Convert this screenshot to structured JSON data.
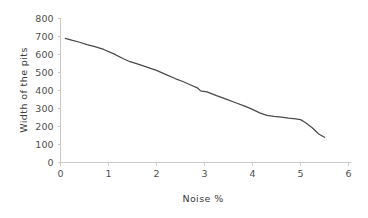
{
  "chart_data": {
    "type": "line",
    "title": "",
    "xlabel": "Noise %",
    "ylabel": "Width of the pits",
    "xlim": [
      0,
      6
    ],
    "ylim": [
      0,
      800
    ],
    "x_ticks": [
      0,
      1,
      2,
      3,
      4,
      5,
      6
    ],
    "y_ticks": [
      0,
      100,
      200,
      300,
      400,
      500,
      600,
      700,
      800
    ],
    "x_tick_labels": [
      "0",
      "1",
      "2",
      "3",
      "4",
      "5",
      "6"
    ],
    "y_tick_labels": [
      "0",
      "100",
      "200",
      "300",
      "400",
      "500",
      "600",
      "700",
      "800"
    ],
    "grid": false,
    "legend": null,
    "legend_position": "none",
    "line_color": "#4a4a4a",
    "axis_color": "#c9c9c9",
    "series": [
      {
        "name": "Width of the pits",
        "x": [
          0.1,
          0.25,
          0.4,
          0.55,
          0.7,
          0.9,
          1.1,
          1.3,
          1.45,
          1.6,
          1.8,
          2.0,
          2.2,
          2.4,
          2.55,
          2.7,
          2.85,
          2.92,
          3.05,
          3.25,
          3.45,
          3.65,
          3.85,
          4.0,
          4.15,
          4.3,
          4.45,
          4.6,
          4.75,
          4.9,
          5.0,
          5.1,
          5.25,
          5.38,
          5.5
        ],
        "y": [
          690,
          678,
          668,
          655,
          645,
          628,
          605,
          578,
          560,
          548,
          530,
          512,
          488,
          465,
          450,
          432,
          415,
          398,
          392,
          372,
          352,
          332,
          312,
          295,
          276,
          262,
          256,
          252,
          246,
          242,
          238,
          222,
          192,
          158,
          140
        ]
      }
    ]
  },
  "axis_labels": {
    "x_title": "Noise %",
    "y_title": "Width of the pits"
  }
}
